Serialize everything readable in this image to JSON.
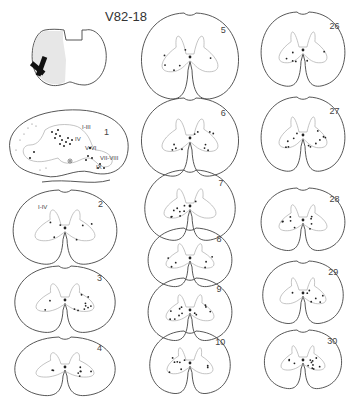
{
  "figure": {
    "title": "V82-18",
    "lesion_diagram": {
      "description": "lesion-marker"
    },
    "sections": [
      {
        "label": "1",
        "laminae": [
          "I-III",
          "IV",
          "V-VI",
          "VII-VIII",
          "IX"
        ]
      },
      {
        "label": "2",
        "laminae": [
          "I-IV"
        ]
      },
      {
        "label": "3",
        "laminae": []
      },
      {
        "label": "4",
        "laminae": []
      },
      {
        "label": "5",
        "laminae": []
      },
      {
        "label": "6",
        "laminae": []
      },
      {
        "label": "7",
        "laminae": []
      },
      {
        "label": "8",
        "laminae": []
      },
      {
        "label": "9",
        "laminae": []
      },
      {
        "label": "10",
        "laminae": []
      },
      {
        "label": "26",
        "laminae": []
      },
      {
        "label": "27",
        "laminae": []
      },
      {
        "label": "28",
        "laminae": []
      },
      {
        "label": "29",
        "laminae": []
      },
      {
        "label": "30",
        "laminae": []
      }
    ]
  }
}
